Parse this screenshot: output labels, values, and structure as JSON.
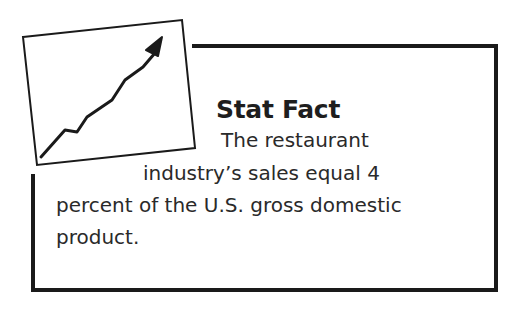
{
  "sidebar_box": {
    "title": "Stat Fact",
    "icon": "rising-line-chart-icon",
    "lines": [
      "The restaurant",
      "industry’s sales equal 4",
      "percent of the U.S. gross domestic",
      "product."
    ]
  },
  "colors": {
    "border": "#1a1a1a",
    "text": "#2a2a2a",
    "background": "#ffffff"
  }
}
